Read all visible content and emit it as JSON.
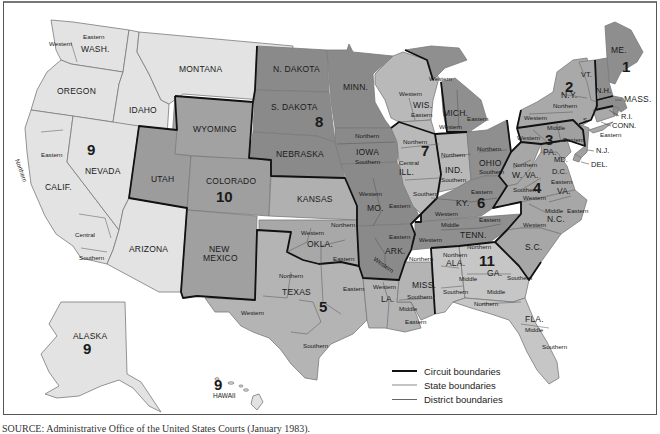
{
  "figure": {
    "colors": {
      "circuit_1": "#8c8c8c",
      "circuit_2": "#a9a9a9",
      "circuit_3": "#9f9f9f",
      "circuit_4": "#a6a6a6",
      "circuit_5": "#b3b3b3",
      "circuit_6": "#8e8e8e",
      "circuit_7": "#b8b8b8",
      "circuit_8": "#888888",
      "circuit_9": "#e2e2e2",
      "circuit_10": "#a0a0a0",
      "circuit_11": "#c4c4c4",
      "circuit_boundary": "#111111",
      "state_boundary": "#bdbdbd",
      "district_boundary": "#666666"
    },
    "circuits": [
      {
        "number": "1",
        "states": [
          "ME.",
          "N.H.",
          "MASS.",
          "R.I."
        ]
      },
      {
        "number": "2",
        "states": [
          "VT.",
          "N.Y.",
          "CONN."
        ]
      },
      {
        "number": "3",
        "states": [
          "PA.",
          "N.J.",
          "DEL."
        ]
      },
      {
        "number": "4",
        "states": [
          "MD.",
          "W. VA.",
          "VA.",
          "N.C.",
          "S.C."
        ]
      },
      {
        "number": "5",
        "states": [
          "TEXAS",
          "LA.",
          "MISS."
        ]
      },
      {
        "number": "6",
        "states": [
          "OHIO",
          "MICH.",
          "KY.",
          "TENN."
        ]
      },
      {
        "number": "7",
        "states": [
          "WIS.",
          "ILL.",
          "IND."
        ]
      },
      {
        "number": "8",
        "states": [
          "N. DAKOTA",
          "S. DAKOTA",
          "NEBRASKA",
          "MINN.",
          "IOWA",
          "MO.",
          "ARK."
        ]
      },
      {
        "number": "9",
        "states": [
          "WASH.",
          "OREGON",
          "CALIF.",
          "NEVADA",
          "IDAHO",
          "MONTANA",
          "ARIZONA",
          "ALASKA",
          "HAWAII"
        ]
      },
      {
        "number": "10",
        "states": [
          "WYOMING",
          "UTAH",
          "COLORADO",
          "KANSAS",
          "NEW MEXICO",
          "OKLA."
        ]
      },
      {
        "number": "11",
        "states": [
          "ALA.",
          "GA.",
          "FLA."
        ]
      }
    ],
    "state_labels": {
      "wash": "WASH.",
      "oregon": "OREGON",
      "idaho": "IDAHO",
      "montana": "MONTANA",
      "calif": "CALIF.",
      "nevada": "NEVADA",
      "arizona": "ARIZONA",
      "utah": "UTAH",
      "wyoming": "WYOMING",
      "colorado": "COLORADO",
      "new_mexico_1": "NEW",
      "new_mexico_2": "MEXICO",
      "ndakota": "N. DAKOTA",
      "sdakota": "S. DAKOTA",
      "nebraska": "NEBRASKA",
      "kansas": "KANSAS",
      "okla": "OKLA.",
      "texas": "TEXAS",
      "minn": "MINN.",
      "iowa": "IOWA",
      "mo": "MO.",
      "ark": "ARK.",
      "la": "LA.",
      "wis": "WIS.",
      "ill": "ILL.",
      "mich": "MICH.",
      "ind": "IND.",
      "ohio": "OHIO",
      "ky": "KY.",
      "tenn": "TENN.",
      "miss": "MISS.",
      "ala": "ALA.",
      "ga": "GA.",
      "fla": "FLA.",
      "sc": "S.C.",
      "nc": "N.C.",
      "va": "VA.",
      "wva": "W. VA.",
      "md": "MD.",
      "dc": "D.C.",
      "pa": "PA.",
      "ny": "N.Y.",
      "vt": "VT.",
      "nh": "N.H.",
      "me": "ME.",
      "mass": "MASS.",
      "ri": "R.I.",
      "conn": "CONN.",
      "nj": "N.J.",
      "del": "DEL.",
      "alaska": "ALASKA",
      "hawaii": "HAWAII"
    },
    "circuit_labels": {
      "c1": "1",
      "c2": "2",
      "c3": "3",
      "c4": "4",
      "c5": "5",
      "c6": "6",
      "c7": "7",
      "c8": "8",
      "c9": "9",
      "c9_alaska": "9",
      "c9_hawaii": "9",
      "c10": "10",
      "c11": "11"
    },
    "district_labels": {
      "wash_w": "Western",
      "wash_e": "Eastern",
      "calif_n": "Northern",
      "calif_e": "Eastern",
      "calif_c": "Central",
      "calif_s": "Southern",
      "okla_w": "Western",
      "okla_n": "Northern",
      "okla_e": "Eastern",
      "tex_n": "Northern",
      "tex_w": "Western",
      "tex_e": "Eastern",
      "tex_s": "Southern",
      "iowa_n": "Northern",
      "iowa_s": "Southern",
      "mo_w": "Western",
      "mo_e": "Eastern",
      "ark_e": "Eastern",
      "ark_w": "Western",
      "la_w": "Western",
      "la_m": "Middle",
      "la_e": "Eastern",
      "miss_n": "Northern",
      "miss_s": "Southern",
      "wis_w": "Western",
      "wis_e": "Eastern",
      "mich_w": "Western",
      "mich_w2": "Western",
      "mich_e": "Eastern",
      "ill_n": "Northern",
      "ill_c": "Central",
      "ill_s": "Southern",
      "ind_n": "Northern",
      "ind_s": "Southern",
      "ohio_n": "Northern",
      "ohio_s": "Southern",
      "ky_e": "Eastern",
      "ky_w": "Western",
      "tenn_e": "Eastern",
      "tenn_m": "Middle",
      "tenn_w": "Western",
      "ala_n": "Northern",
      "ala_m": "Middle",
      "ala_s": "Southern",
      "ga_n": "Northern",
      "ga_m": "Middle",
      "ga_s": "Southern",
      "fla_n": "Northern",
      "fla_m": "Middle",
      "fla_s": "Southern",
      "wva_n": "Northern",
      "wva_s": "Southern",
      "va_w": "Western",
      "va_e": "Eastern",
      "nc_w": "Western",
      "nc_m": "Middle",
      "nc_e": "Eastern",
      "pa_w": "Western",
      "pa_m": "Middle",
      "pa_e": "Eastern",
      "ny_w": "Western",
      "ny_n": "Northern",
      "ny_s": "S",
      "ny_e": "Eastern"
    },
    "legend": [
      {
        "label": "Circuit boundaries",
        "style": "thick-black"
      },
      {
        "label": "State boundaries",
        "style": "thick-light-gray"
      },
      {
        "label": "District boundaries",
        "style": "thin-gray"
      }
    ],
    "source": "SOURCE: Administrative Office of the United States Courts (January 1983)."
  }
}
